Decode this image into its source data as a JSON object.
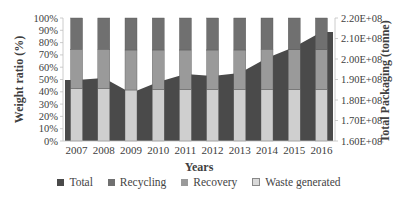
{
  "chart_data": {
    "type": "bar",
    "subtype": "stacked-100-bar-with-area-secondary-axis",
    "title": "",
    "xlabel": "Years",
    "ylabel": "Weight ratio (%)",
    "y2label": "Total Packaging (tonne)",
    "categories": [
      "2007",
      "2008",
      "2009",
      "2010",
      "2011",
      "2012",
      "2013",
      "2014",
      "2015",
      "2016"
    ],
    "ylim": [
      0,
      100
    ],
    "y2lim": [
      160000000,
      220000000
    ],
    "y_ticks": [
      "0%",
      "10%",
      "20%",
      "30%",
      "40%",
      "50%",
      "60%",
      "70%",
      "80%",
      "90%",
      "100%"
    ],
    "y2_ticks": [
      "1.60E+08",
      "1.70E+08",
      "1.80E+08",
      "1.90E+08",
      "2.00E+08",
      "2.10E+08",
      "2.20E+08"
    ],
    "series": [
      {
        "name": "Total",
        "type": "area",
        "axis": "secondary",
        "color": "#4a4a4a",
        "values": [
          189800000,
          190700000,
          183400000,
          188800000,
          192700000,
          191700000,
          193200000,
          200500000,
          205900000,
          213200000
        ]
      },
      {
        "name": "Recycling",
        "type": "bar",
        "axis": "primary",
        "color": "#707070",
        "values": [
          25.5,
          25.5,
          26,
          26,
          26,
          26,
          26,
          25.5,
          25.5,
          25.5
        ]
      },
      {
        "name": "Recovery",
        "type": "bar",
        "axis": "primary",
        "color": "#9a9a9a",
        "values": [
          32,
          32,
          32.5,
          32,
          32,
          32,
          32,
          32.5,
          32.5,
          32.5
        ]
      },
      {
        "name": "Waste generated",
        "type": "bar",
        "axis": "primary",
        "color": "#cfcfcf",
        "values": [
          42.5,
          42.5,
          41.5,
          42,
          42,
          42,
          42,
          42,
          42,
          42
        ]
      }
    ],
    "legend_position": "bottom",
    "grid": false
  },
  "labels": {
    "xlabel": "Years",
    "ylabel": "Weight ratio (%)",
    "y2label": "Total Packaging (tonne)"
  },
  "legend": [
    {
      "label": "Total",
      "color": "#4a4a4a"
    },
    {
      "label": "Recycling",
      "color": "#707070"
    },
    {
      "label": "Recovery",
      "color": "#9a9a9a"
    },
    {
      "label": "Waste generated",
      "color": "#d9d9d9"
    }
  ]
}
